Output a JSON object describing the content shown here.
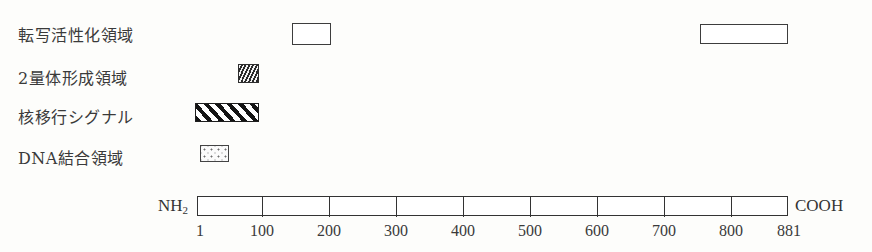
{
  "figure": {
    "legend_rows": [
      {
        "label": "転写活性化領域",
        "swatch_style": "open-rectangle",
        "segments": [
          {
            "start": 145,
            "end": 200
          },
          {
            "start": 745,
            "end": 873
          }
        ]
      },
      {
        "label": "2量体形成領域",
        "swatch_style": "wave-hatch",
        "segments": [
          {
            "start": 62,
            "end": 90
          }
        ]
      },
      {
        "label": "核移行シグナル",
        "swatch_style": "diagonal-hatch",
        "segments": [
          {
            "start": 1,
            "end": 90
          }
        ]
      },
      {
        "label": "DNA結合領域",
        "swatch_style": "dot-stipple",
        "segments": [
          {
            "start": 10,
            "end": 50
          }
        ]
      }
    ],
    "axis": {
      "n_terminus": "NH",
      "n_terminus_sub": "2",
      "c_terminus": "COOH",
      "start_label": "1",
      "end_label": "881",
      "tick_labels": [
        "1",
        "100",
        "200",
        "300",
        "400",
        "500",
        "600",
        "700",
        "800",
        "881"
      ],
      "range_start": 1,
      "range_end": 881
    },
    "colors": {
      "background": "#fdfdfb",
      "ink": "#333333",
      "text": "#3a3a3a",
      "hatch_dark": "#141414",
      "hatch_light": "#ffffff"
    }
  }
}
